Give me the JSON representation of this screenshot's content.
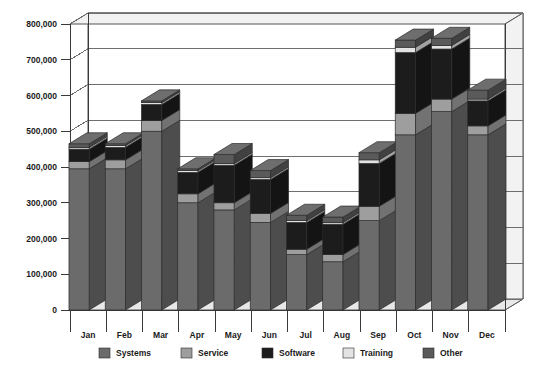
{
  "chart_data": {
    "type": "bar",
    "subtype": "stacked-bar-3d",
    "title": "",
    "xlabel": "",
    "ylabel": "",
    "ylim": [
      0,
      800000
    ],
    "y_ticks": [
      0,
      100000,
      200000,
      300000,
      400000,
      500000,
      600000,
      700000,
      800000
    ],
    "y_tick_labels": [
      "0",
      "100,000",
      "200,000",
      "300,000",
      "400,000",
      "500,000",
      "600,000",
      "700,000",
      "800,000"
    ],
    "grid": "horizontal",
    "legend_position": "bottom",
    "categories": [
      "Jan",
      "Feb",
      "Mar",
      "Apr",
      "May",
      "Jun",
      "Jul",
      "Aug",
      "Sep",
      "Oct",
      "Nov",
      "Dec"
    ],
    "series": [
      {
        "name": "Systems",
        "color": "#6b6b6b",
        "values": [
          395000,
          395000,
          500000,
          300000,
          280000,
          245000,
          155000,
          135000,
          250000,
          490000,
          555000,
          490000
        ]
      },
      {
        "name": "Service",
        "color": "#9e9e9e",
        "values": [
          20000,
          25000,
          30000,
          25000,
          20000,
          25000,
          15000,
          20000,
          40000,
          60000,
          35000,
          25000
        ]
      },
      {
        "name": "Software",
        "color": "#1c1c1c",
        "values": [
          35000,
          35000,
          45000,
          60000,
          105000,
          95000,
          75000,
          85000,
          120000,
          170000,
          140000,
          70000
        ]
      },
      {
        "name": "Training",
        "color": "#e3e3e3",
        "values": [
          5000,
          5000,
          5000,
          5000,
          5000,
          5000,
          5000,
          5000,
          10000,
          15000,
          10000,
          5000
        ]
      },
      {
        "name": "Other",
        "color": "#5a5a5a",
        "values": [
          10000,
          5000,
          5000,
          5000,
          25000,
          20000,
          15000,
          15000,
          20000,
          20000,
          20000,
          25000
        ]
      }
    ],
    "totals": [
      465000,
      465000,
      585000,
      395000,
      435000,
      390000,
      265000,
      260000,
      440000,
      755000,
      760000,
      615000
    ]
  },
  "legend": {
    "items": [
      {
        "label": "Systems"
      },
      {
        "label": "Service"
      },
      {
        "label": "Software"
      },
      {
        "label": "Training"
      },
      {
        "label": "Other"
      }
    ]
  }
}
